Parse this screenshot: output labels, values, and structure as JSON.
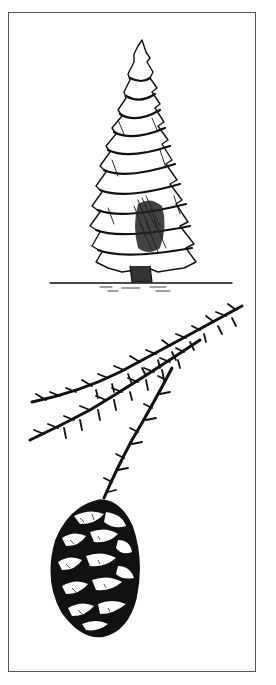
{
  "illustration": {
    "style": "black-and-white pen-and-ink botanical drawing",
    "colors": {
      "ink": "#111111",
      "paper": "#ffffff",
      "frame": "#555555"
    },
    "panels": [
      {
        "name": "tree",
        "subject": "conifer tree (redwood-like) standing on a ground line"
      },
      {
        "name": "branch",
        "subject": "foliage sprig with two scaly shoots"
      },
      {
        "name": "cone",
        "subject": "ovoid scaly seed cone hanging from the lower shoot"
      }
    ]
  }
}
